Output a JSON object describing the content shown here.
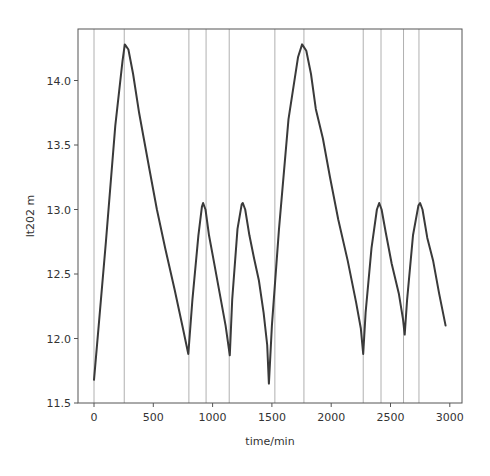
{
  "chart_data": {
    "type": "line",
    "title": "",
    "xlabel": "time/min",
    "ylabel": "lt202 m",
    "xlim": [
      -130,
      3110
    ],
    "ylim": [
      11.5,
      14.38
    ],
    "xticks": [
      0,
      500,
      1000,
      1500,
      2000,
      2500,
      3000
    ],
    "xtick_labels": [
      "0",
      "500",
      "1000",
      "1500",
      "2000",
      "2500",
      "3000"
    ],
    "yticks": [
      11.5,
      12.0,
      12.5,
      13.0,
      13.5,
      14.0
    ],
    "ytick_labels": [
      "11.5",
      "12.0",
      "12.5",
      "13.0",
      "13.5",
      "14.0"
    ],
    "grid": false,
    "legend": null,
    "series": [
      {
        "name": "lt202",
        "color": "#3a3a3a",
        "x": [
          0,
          40,
          100,
          180,
          240,
          260,
          290,
          330,
          380,
          420,
          470,
          530,
          600,
          680,
          750,
          795,
          830,
          880,
          910,
          920,
          940,
          970,
          1010,
          1060,
          1110,
          1145,
          1165,
          1210,
          1245,
          1255,
          1275,
          1310,
          1350,
          1390,
          1430,
          1460,
          1475,
          1500,
          1560,
          1640,
          1720,
          1755,
          1790,
          1830,
          1870,
          1930,
          1990,
          2060,
          2140,
          2210,
          2250,
          2270,
          2290,
          2340,
          2385,
          2405,
          2425,
          2460,
          2510,
          2570,
          2605,
          2620,
          2640,
          2690,
          2735,
          2750,
          2770,
          2810,
          2860,
          2910,
          2965
        ],
        "y": [
          11.68,
          12.1,
          12.75,
          13.65,
          14.15,
          14.28,
          14.24,
          14.05,
          13.75,
          13.55,
          13.3,
          13.0,
          12.7,
          12.38,
          12.08,
          11.88,
          12.3,
          12.8,
          13.02,
          13.05,
          13.0,
          12.8,
          12.6,
          12.35,
          12.1,
          11.87,
          12.3,
          12.85,
          13.04,
          13.05,
          13.0,
          12.8,
          12.62,
          12.45,
          12.2,
          11.95,
          11.65,
          12.1,
          12.85,
          13.7,
          14.18,
          14.28,
          14.23,
          14.05,
          13.78,
          13.55,
          13.25,
          12.92,
          12.6,
          12.28,
          12.08,
          11.88,
          12.2,
          12.7,
          13.0,
          13.05,
          13.0,
          12.82,
          12.58,
          12.35,
          12.15,
          12.03,
          12.3,
          12.8,
          13.03,
          13.05,
          13.0,
          12.78,
          12.6,
          12.35,
          12.1
        ]
      }
    ],
    "vertical_lines": {
      "color": "#b0b0b0",
      "x": [
        0,
        255,
        800,
        945,
        1140,
        1525,
        1770,
        2270,
        2420,
        2610,
        2740
      ]
    }
  }
}
